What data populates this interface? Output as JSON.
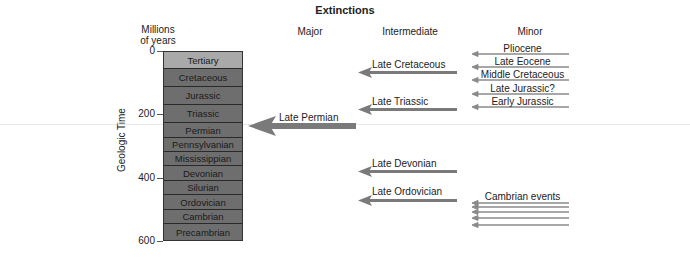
{
  "title": "Extinctions",
  "column_headers": {
    "major": "Major",
    "intermediate": "Intermediate",
    "minor": "Minor"
  },
  "y_axis": {
    "unit_label_line1": "Millions",
    "unit_label_line2": "of years",
    "title": "Geologic Time",
    "ticks": [
      "0",
      "200",
      "400",
      "600"
    ]
  },
  "periods": [
    {
      "name": "Tertiary",
      "shade": "#a9a9a9"
    },
    {
      "name": "Cretaceous",
      "shade": "#6e6e6e"
    },
    {
      "name": "Jurassic",
      "shade": "#6e6e6e"
    },
    {
      "name": "Triassic",
      "shade": "#6e6e6e"
    },
    {
      "name": "Permian",
      "shade": "#6e6e6e"
    },
    {
      "name": "Pennsylvanian",
      "shade": "#6e6e6e"
    },
    {
      "name": "Mississippian",
      "shade": "#6e6e6e"
    },
    {
      "name": "Devonian",
      "shade": "#6e6e6e"
    },
    {
      "name": "Silurian",
      "shade": "#6e6e6e"
    },
    {
      "name": "Ordovician",
      "shade": "#6e6e6e"
    },
    {
      "name": "Cambrian",
      "shade": "#6e6e6e"
    },
    {
      "name": "Precambrian",
      "shade": "#6e6e6e"
    }
  ],
  "extinctions": {
    "major": [
      {
        "label": "Late Permian"
      }
    ],
    "intermediate": [
      {
        "label": "Late Cretaceous"
      },
      {
        "label": "Late Triassic"
      },
      {
        "label": "Late Devonian"
      },
      {
        "label": "Late Ordovician"
      }
    ],
    "minor": [
      {
        "label": "Pliocene"
      },
      {
        "label": "Late Eocene"
      },
      {
        "label": "Middle Cretaceous"
      },
      {
        "label": "Late Jurassic?"
      },
      {
        "label": "Early Jurassic"
      },
      {
        "label": "Cambrian events"
      }
    ]
  },
  "colors": {
    "arrow": "#7a7a7a",
    "minor_arrow": "#8a8a8a"
  }
}
